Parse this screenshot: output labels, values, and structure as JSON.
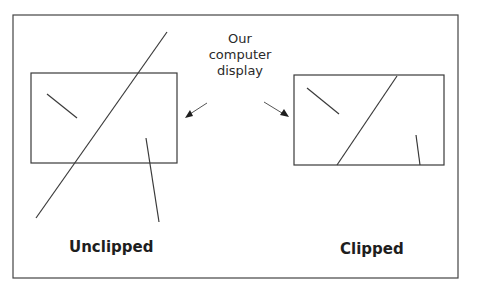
{
  "diagram": {
    "callout": {
      "lines": [
        "Our",
        "computer",
        "display"
      ]
    },
    "panels": [
      {
        "id": "unclipped",
        "label": "Unclipped"
      },
      {
        "id": "clipped",
        "label": "Clipped"
      }
    ],
    "colors": {
      "stroke": "#3a3a3a",
      "text": "#1e1e1e",
      "background": "#ffffff"
    }
  }
}
